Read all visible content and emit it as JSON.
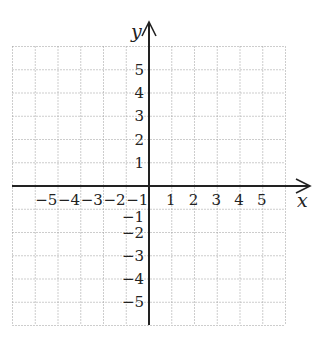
{
  "diagram": {
    "type": "coordinate-plane",
    "grid": {
      "x_min": -6,
      "x_max": 6,
      "y_min": -6,
      "y_max": 6,
      "style": "dotted",
      "color": "#9a9a9a"
    },
    "axes": {
      "color": "#222222",
      "x_label": "x",
      "y_label": "y",
      "x_ticks": [
        {
          "value": -5,
          "label": "−5"
        },
        {
          "value": -4,
          "label": "−4"
        },
        {
          "value": -3,
          "label": "−3"
        },
        {
          "value": -2,
          "label": "−2"
        },
        {
          "value": -1,
          "label": "−1"
        },
        {
          "value": 1,
          "label": "1"
        },
        {
          "value": 2,
          "label": "2"
        },
        {
          "value": 3,
          "label": "3"
        },
        {
          "value": 4,
          "label": "4"
        },
        {
          "value": 5,
          "label": "5"
        }
      ],
      "y_ticks": [
        {
          "value": 5,
          "label": "5"
        },
        {
          "value": 4,
          "label": "4"
        },
        {
          "value": 3,
          "label": "3"
        },
        {
          "value": 2,
          "label": "2"
        },
        {
          "value": 1,
          "label": "1"
        },
        {
          "value": -1,
          "label": "−1"
        },
        {
          "value": -2,
          "label": "−2"
        },
        {
          "value": -3,
          "label": "−3"
        },
        {
          "value": -4,
          "label": "−4"
        },
        {
          "value": -5,
          "label": "−5"
        }
      ]
    }
  }
}
